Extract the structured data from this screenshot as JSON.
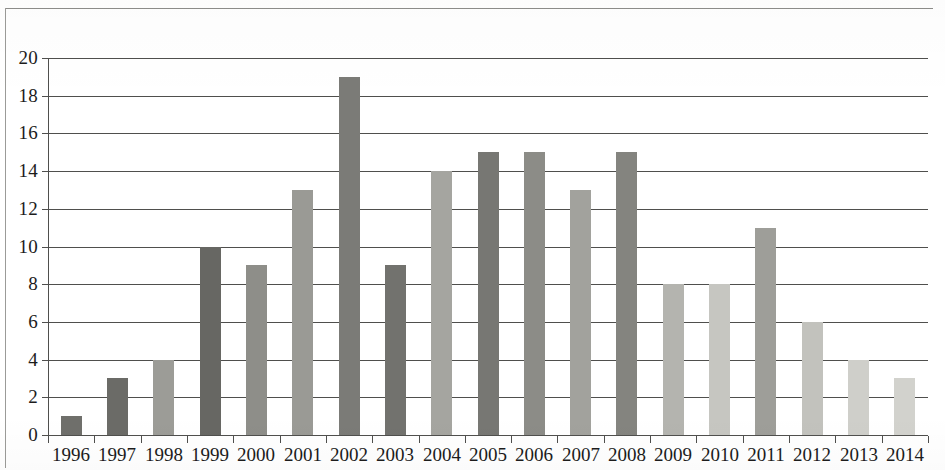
{
  "chart_data": {
    "type": "bar",
    "title": "",
    "subtitle": "",
    "xlabel": "",
    "ylabel": "",
    "categories": [
      "1996",
      "1997",
      "1998",
      "1999",
      "2000",
      "2001",
      "2002",
      "2003",
      "2004",
      "2005",
      "2006",
      "2007",
      "2008",
      "2009",
      "2010",
      "2011",
      "2012",
      "2013",
      "2014"
    ],
    "values": [
      1,
      3,
      4,
      10,
      9,
      13,
      19,
      9,
      14,
      15,
      15,
      13,
      15,
      8,
      8,
      11,
      6,
      4,
      3
    ],
    "series": [
      {
        "name": "",
        "values": [
          1,
          3,
          4,
          10,
          9,
          13,
          19,
          9,
          14,
          15,
          15,
          13,
          15,
          8,
          8,
          11,
          6,
          4,
          3
        ]
      }
    ],
    "bar_colors": [
      "#6f6f6b",
      "#6b6b67",
      "#9c9c97",
      "#676763",
      "#8e8e89",
      "#9a9a95",
      "#7b7b77",
      "#72726e",
      "#a5a5a0",
      "#777773",
      "#8c8c87",
      "#a2a29d",
      "#84847f",
      "#b4b4af",
      "#c6c6c1",
      "#9e9e99",
      "#c2c2bd",
      "#cfcfca",
      "#d2d2cd"
    ],
    "ylim": [
      0,
      20
    ],
    "ytick_values": [
      "0",
      "2",
      "4",
      "6",
      "8",
      "10",
      "12",
      "14",
      "16",
      "18",
      "20"
    ],
    "ytick_step": 2,
    "grid": true,
    "grid_axis": "y",
    "legend": false,
    "legend_position": "none",
    "axis_color": "#4f4f4d",
    "background": "#ffffff",
    "annotations": []
  }
}
